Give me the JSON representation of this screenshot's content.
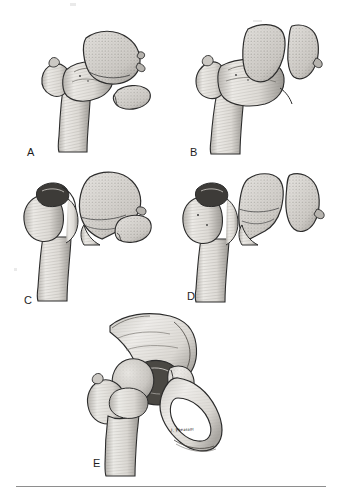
{
  "figure": {
    "kind": "medical-line-illustration",
    "background_color": "#ffffff",
    "ink_color": "#1d1d1d",
    "bone_fill_color": "#d7d5d1",
    "bone_shade_color": "#9e9b96",
    "rule_color": "#8e8e8e",
    "artist_signature": "J. Pheasant"
  },
  "panels": [
    {
      "id": "a",
      "label": "A",
      "caption": "Proximal femur with femoral head and small inferior fragment displaced",
      "parts": [
        "femoral shaft",
        "greater trochanter",
        "femoral neck",
        "femoral head",
        "small infrafoveal fragment"
      ]
    },
    {
      "id": "b",
      "label": "B",
      "caption": "Proximal femur with femoral head split into two large fragments",
      "parts": [
        "femoral shaft",
        "greater trochanter",
        "femoral neck",
        "femoral head fragment",
        "separated head fragment"
      ]
    },
    {
      "id": "c",
      "label": "C",
      "caption": "Femoral neck fracture with displaced head and small separate fragment",
      "parts": [
        "femoral shaft",
        "greater trochanter",
        "fractured femoral neck",
        "displaced femoral head",
        "small fragment"
      ]
    },
    {
      "id": "d",
      "label": "D",
      "caption": "Femoral neck fracture with head split into two displaced fragments",
      "parts": [
        "femoral shaft",
        "greater trochanter",
        "fractured femoral neck",
        "head fragment",
        "head fragment"
      ]
    },
    {
      "id": "e",
      "label": "E",
      "caption": "Acetabular rim fracture with proximal femur articulated in the hip joint",
      "parts": [
        "ilium",
        "acetabulum",
        "acetabular rim fracture",
        "obturator foramen",
        "pubis",
        "ischium",
        "femoral head",
        "greater trochanter",
        "femoral shaft"
      ]
    }
  ],
  "labels": {
    "a": "A",
    "b": "B",
    "c": "C",
    "d": "D",
    "e": "E"
  },
  "signature": {
    "text": "J. Pheasant"
  }
}
